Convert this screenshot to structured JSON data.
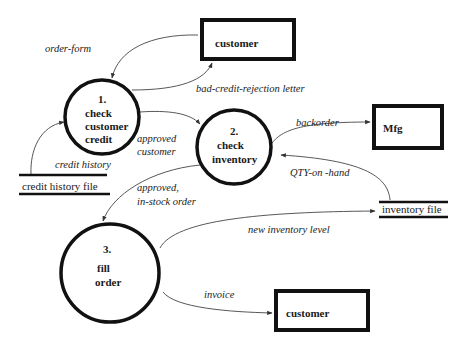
{
  "diagram": {
    "type": "data-flow-diagram",
    "processes": [
      {
        "id": "p1",
        "number": "1.",
        "lines": [
          "check",
          "customer",
          "credit"
        ]
      },
      {
        "id": "p2",
        "number": "2.",
        "lines": [
          "check",
          "inventory"
        ]
      },
      {
        "id": "p3",
        "number": "3.",
        "lines": [
          "fill",
          "order"
        ]
      }
    ],
    "entities": [
      {
        "id": "e1",
        "label": "customer"
      },
      {
        "id": "e2",
        "label": "Mfg"
      },
      {
        "id": "e3",
        "label": "customer"
      }
    ],
    "stores": [
      {
        "id": "s1",
        "label": "credit history file"
      },
      {
        "id": "s2",
        "label": "inventory file"
      }
    ],
    "flows": [
      {
        "id": "f1",
        "label": "order-form",
        "from": "e1",
        "to": "p1"
      },
      {
        "id": "f2",
        "label": "bad-credit-rejection letter",
        "from": "p1",
        "to": "e1"
      },
      {
        "id": "f3",
        "label": "credit history",
        "from": "s1",
        "to": "p1"
      },
      {
        "id": "f4",
        "label_line1": "approved",
        "label_line2": "customer",
        "from": "p1",
        "to": "p2"
      },
      {
        "id": "f5",
        "label": "backorder",
        "from": "p2",
        "to": "e2"
      },
      {
        "id": "f6",
        "label": "QTY-on -hand",
        "from": "s2",
        "to": "p2"
      },
      {
        "id": "f7",
        "label_line1": "approved,",
        "label_line2": "in-stock order",
        "from": "p2",
        "to": "p3"
      },
      {
        "id": "f8",
        "label": "new inventory level",
        "from": "p3",
        "to": "s2"
      },
      {
        "id": "f9",
        "label": "invoice",
        "from": "p3",
        "to": "e3"
      }
    ]
  }
}
